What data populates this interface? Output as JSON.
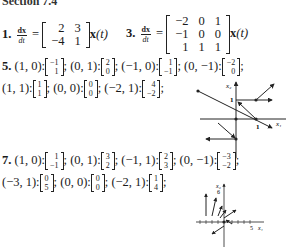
{
  "header": {
    "title": "Section 7.4"
  },
  "problem1": {
    "number": "1.",
    "lhs_num": "dx",
    "lhs_den": "dt",
    "equals": "=",
    "matrix": [
      [
        "2",
        "3"
      ],
      [
        "−4",
        "1"
      ]
    ],
    "rhs": "x",
    "rhs_arg": "(t)"
  },
  "problem3": {
    "number": "3.",
    "lhs_num": "dx",
    "lhs_den": "dt",
    "equals": "=",
    "matrix": [
      [
        "−2",
        "0",
        "1"
      ],
      [
        "−1",
        "0",
        "0"
      ],
      [
        "1",
        "1",
        "1"
      ]
    ],
    "rhs": "x",
    "rhs_arg": "(t)"
  },
  "problem5": {
    "number": "5.",
    "pairs": [
      {
        "point": "(1, 0):",
        "vec": [
          "−1",
          "1"
        ]
      },
      {
        "point": "(0, 1):",
        "vec": [
          "2",
          "0"
        ]
      },
      {
        "point": "(−1, 0):",
        "vec": [
          "1",
          "−1"
        ]
      },
      {
        "point": "(0, −1):",
        "vec": [
          "−2",
          "0"
        ]
      },
      {
        "point": "(1, 1):",
        "vec": [
          "1",
          "1"
        ]
      },
      {
        "point": "(0, 0):",
        "vec": [
          "0",
          "0"
        ]
      },
      {
        "point": "(−2, 1):",
        "vec": [
          "4",
          "−2"
        ]
      }
    ],
    "graph": {
      "x_label": "x₁",
      "y_label": "x₂",
      "x_tick": "1",
      "y_tick": "1"
    }
  },
  "problem7": {
    "number": "7.",
    "pairs": [
      {
        "point": "(1, 0):",
        "vec": [
          "1",
          "−1"
        ]
      },
      {
        "point": "(0, 1):",
        "vec": [
          "3",
          "2"
        ]
      },
      {
        "point": "(−1, 1):",
        "vec": [
          "2",
          "3"
        ]
      },
      {
        "point": "(0, −1):",
        "vec": [
          "−3",
          "−2"
        ]
      },
      {
        "point": "(−3, 1):",
        "vec": [
          "0",
          "5"
        ]
      },
      {
        "point": "(0, 0):",
        "vec": [
          "0",
          "0"
        ]
      },
      {
        "point": "(−2, 1):",
        "vec": [
          "1",
          "4"
        ]
      }
    ],
    "graph": {
      "x_label": "x₁",
      "y_label": "x₂",
      "x_tick": "5",
      "y_tick": "6"
    }
  },
  "separator": ";"
}
